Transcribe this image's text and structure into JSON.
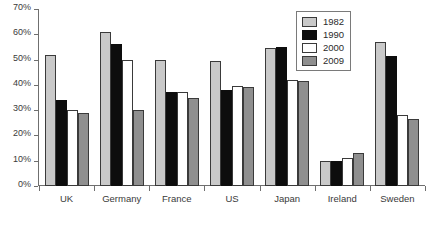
{
  "chart_data": {
    "type": "bar",
    "title": "",
    "xlabel": "",
    "ylabel": "",
    "ylim": [
      0,
      70
    ],
    "y_ticks": [
      "0%",
      "10%",
      "20%",
      "30%",
      "40%",
      "50%",
      "60%",
      "70%"
    ],
    "y_tick_values": [
      0,
      10,
      20,
      30,
      40,
      50,
      60,
      70
    ],
    "grid": false,
    "legend_position": "top-right",
    "categories": [
      "UK",
      "Germany",
      "France",
      "US",
      "Japan",
      "Ireland",
      "Sweden"
    ],
    "series": [
      {
        "name": "1982",
        "color": "#c9c9c9",
        "values": [
          52,
          61,
          50,
          49.5,
          54.5,
          10,
          57
        ]
      },
      {
        "name": "1990",
        "color": "#0d0d0d",
        "values": [
          34,
          56,
          37,
          38,
          55,
          10,
          51.5
        ]
      },
      {
        "name": "2000",
        "color": "#ffffff",
        "values": [
          30,
          50,
          37,
          39.5,
          42,
          11,
          28
        ]
      },
      {
        "name": "2009",
        "color": "#8f8f8f",
        "values": [
          29,
          30,
          35,
          39,
          41.5,
          13,
          26.5
        ]
      }
    ]
  },
  "caption": {
    "text": ""
  }
}
